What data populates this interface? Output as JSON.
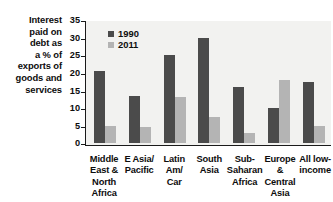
{
  "chart_data": {
    "type": "bar",
    "title": "",
    "ylabel": "Interest paid on debt as a % of exports of goods and services",
    "xlabel": "",
    "ylim": [
      0,
      35
    ],
    "yticks": [
      0,
      5,
      10,
      15,
      20,
      25,
      30,
      35
    ],
    "grid": false,
    "legend_position": "top-left",
    "categories": [
      "Middle East & North Africa",
      "E Asia/ Pacific",
      "Latin Am/ Car",
      "South Asia",
      "Sub- Saharan Africa",
      "Europe & Central Asia",
      "All low- income"
    ],
    "series": [
      {
        "name": "1990",
        "color": "#4b4b4b",
        "values": [
          20.5,
          13.5,
          25.2,
          30.0,
          16.0,
          10.0,
          17.5
        ]
      },
      {
        "name": "2011",
        "color": "#b4b4b4",
        "values": [
          5.0,
          4.7,
          13.3,
          7.5,
          3.0,
          18.0,
          5.0
        ]
      }
    ]
  },
  "axis_caption_lines": [
    "Interest",
    "paid on",
    "debt as",
    "a % of",
    "exports of",
    "goods and",
    "services"
  ],
  "tick_labels": [
    "35",
    "30",
    "25",
    "20",
    "15",
    "10",
    "5",
    "0"
  ],
  "legend": [
    {
      "label": "1990"
    },
    {
      "label": "2011"
    }
  ],
  "category_label_lines": [
    [
      "Middle",
      "East &",
      "North",
      "Africa"
    ],
    [
      "E Asia/",
      "Pacific"
    ],
    [
      "Latin",
      "Am/",
      "Car"
    ],
    [
      "South",
      "Asia"
    ],
    [
      "Sub-",
      "Saharan",
      "Africa"
    ],
    [
      "Europe",
      "&",
      "Central",
      "Asia"
    ],
    [
      "All low-",
      "income"
    ]
  ],
  "colors": {
    "series_1990": "#4b4b4b",
    "series_2011": "#b4b4b4",
    "plot_background": "#f2f2f0",
    "axis": "#1a1a1a",
    "text": "#0d0d0d"
  }
}
